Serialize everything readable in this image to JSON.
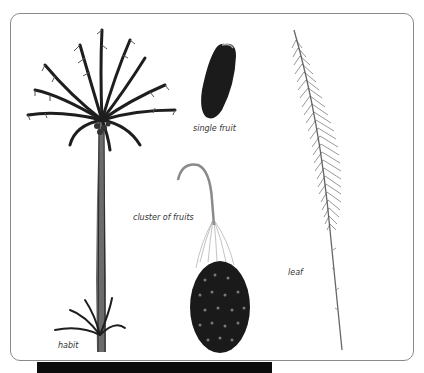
{
  "figure": {
    "labels": {
      "habit": "habit",
      "single_fruit": "single fruit",
      "cluster_of_fruits": "cluster of fruits",
      "leaf": "leaf"
    },
    "colors": {
      "frame_border": "#8a8a8a",
      "ink": "#1a1a1a",
      "bar": "#0c0c0c"
    }
  }
}
